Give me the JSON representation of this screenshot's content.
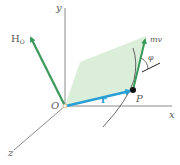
{
  "diagram": {
    "axes": {
      "x_label": "x",
      "y_label": "y",
      "z_label": "z",
      "origin_label": "O"
    },
    "vectors": {
      "angular_momentum": {
        "label": "H",
        "subscript": "O",
        "color": "#3a9a5c"
      },
      "position": {
        "label": "r",
        "color": "#2a9fd6"
      },
      "linear_momentum": {
        "label": "mv",
        "color": "#3a9a5c"
      }
    },
    "point_label": "P",
    "angle_label": "φ",
    "colors": {
      "axis": "#8a8a8a",
      "plane_fill": "#cfe8cf",
      "trajectory": "#555555",
      "point": "#111111"
    }
  }
}
